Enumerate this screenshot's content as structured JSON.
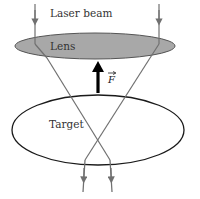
{
  "diagram": {
    "labels": {
      "laser_beam": "Laser beam",
      "lens": "Lens",
      "force": "F",
      "target": "Target"
    },
    "colors": {
      "lens_fill": "#a8a8a8",
      "lens_stroke": "#555555",
      "beam": "#707070",
      "target_stroke": "#1a1a1a",
      "force_arrow": "#000000"
    }
  }
}
